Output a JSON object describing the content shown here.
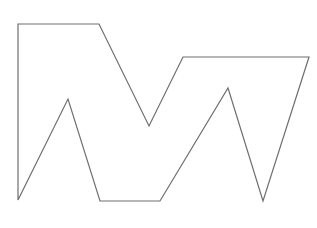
{
  "diagram": {
    "shape": "polygon-outline",
    "stroke_color": "#6e6e6e",
    "stroke_width": 1.2,
    "fill": "none",
    "background": "#ffffff",
    "points": [
      [
        18,
        24
      ],
      [
        99,
        24
      ],
      [
        149,
        126
      ],
      [
        183,
        57
      ],
      [
        309,
        57
      ],
      [
        263,
        201
      ],
      [
        228,
        88
      ],
      [
        160,
        201
      ],
      [
        100,
        201
      ],
      [
        68,
        99
      ],
      [
        18,
        200
      ]
    ]
  }
}
